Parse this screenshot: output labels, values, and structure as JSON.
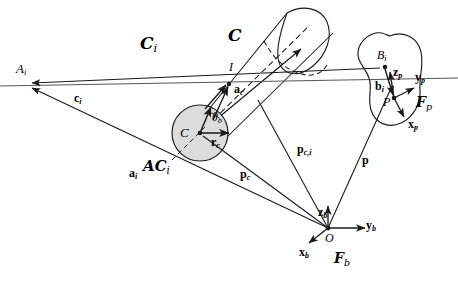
{
  "figure": {
    "background": "#ffffff",
    "stroke": "#1a1a1a",
    "fill_gray": "#d9d9d9",
    "width": 458,
    "height": 286
  },
  "labels": {
    "apex_Ai": {
      "text": "A",
      "sub": "i"
    },
    "cone_Ci": {
      "text": "C",
      "sub": "i"
    },
    "cone_C": {
      "text": "C",
      "sub": ""
    },
    "vec_ci": {
      "text": "c",
      "sub": "i"
    },
    "vec_ai": {
      "text": "a",
      "sub": "i"
    },
    "contact_I": {
      "text": "I",
      "sub": ""
    },
    "vec_ac": {
      "text": "a",
      "sub": "c"
    },
    "center_C": {
      "text": "C",
      "sub": ""
    },
    "angle_thetac": {
      "text": "θ",
      "sub": "c"
    },
    "vec_rc": {
      "text": "r",
      "sub": "c"
    },
    "region_ACi": {
      "text": "AC",
      "sub": "i"
    },
    "vec_pc": {
      "text": "p",
      "sub": "c"
    },
    "vec_pci": {
      "text": "p",
      "sub": "c,i"
    },
    "vec_p": {
      "text": "p",
      "sub": ""
    },
    "point_Bi": {
      "text": "B",
      "sub": "i"
    },
    "vec_bi": {
      "text": "b",
      "sub": "i"
    },
    "point_P": {
      "text": "P",
      "sub": ""
    },
    "axis_zp": {
      "text": "z",
      "sub": "p"
    },
    "axis_yp": {
      "text": "y",
      "sub": "p"
    },
    "axis_xp": {
      "text": "x",
      "sub": "p"
    },
    "frame_Fp": {
      "text": "F",
      "sub": "p"
    },
    "origin_O": {
      "text": "O",
      "sub": ""
    },
    "axis_zb": {
      "text": "z",
      "sub": "b"
    },
    "axis_yb": {
      "text": "y",
      "sub": "b"
    },
    "axis_xb": {
      "text": "x",
      "sub": "b"
    },
    "frame_Fb": {
      "text": "F",
      "sub": "b"
    }
  }
}
